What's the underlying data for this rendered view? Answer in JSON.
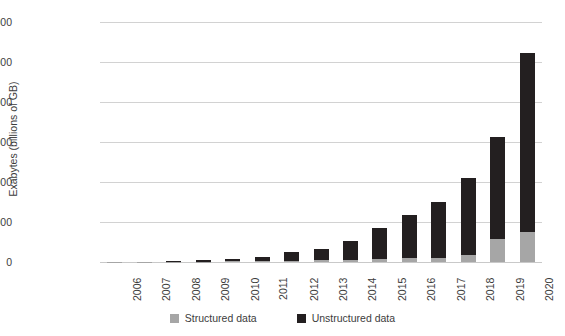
{
  "chart_data": {
    "type": "bar",
    "subtype": "stacked-bar",
    "title": "",
    "xlabel": "",
    "ylabel": "Exabytes (billions of GB)",
    "ylim": [
      0,
      60000
    ],
    "ytick_labels": [
      "60000",
      "50000",
      "40000",
      "30000",
      "20000",
      "10000",
      "0"
    ],
    "ytick_values": [
      60000,
      50000,
      40000,
      30000,
      20000,
      10000,
      0
    ],
    "grid": true,
    "legend_position": "bottom",
    "categories": [
      "2006",
      "2007",
      "2008",
      "2009",
      "2010",
      "2011",
      "2012",
      "2013",
      "2014",
      "2015",
      "2016",
      "2017",
      "2018",
      "2019",
      "2020"
    ],
    "series": [
      {
        "name": "Structured data",
        "color": "#a6a6a6",
        "values": [
          20,
          40,
          70,
          110,
          160,
          230,
          330,
          450,
          600,
          800,
          1100,
          1000,
          1800,
          5800,
          7500
        ]
      },
      {
        "name": "Unstructured data",
        "color": "#231f20",
        "values": [
          30,
          60,
          180,
          390,
          640,
          970,
          2170,
          2750,
          4600,
          7700,
          10700,
          14000,
          19200,
          25450,
          44700
        ]
      }
    ],
    "totals": [
      50,
      100,
      250,
      500,
      800,
      1200,
      2500,
      3200,
      5200,
      8500,
      11800,
      15000,
      21000,
      31250,
      52200
    ]
  },
  "legend": {
    "items": [
      {
        "label": "Structured data",
        "swatch": "legend-swatch-structured"
      },
      {
        "label": "Unstructured data",
        "swatch": "legend-swatch-unstructured"
      }
    ]
  },
  "colors": {
    "structured": "#a6a6a6",
    "unstructured": "#231f20",
    "gridline": "#d2d2d2",
    "text": "#3c3c3c",
    "background": "#ffffff"
  }
}
